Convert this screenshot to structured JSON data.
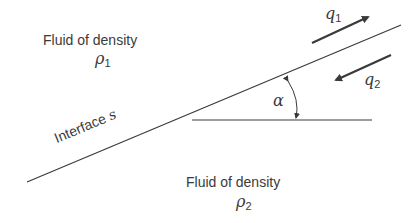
{
  "diagram": {
    "upper_fluid": {
      "label": "Fluid of density",
      "symbol": "ρ",
      "subscript": "1"
    },
    "lower_fluid": {
      "label": "Fluid of density",
      "symbol": "ρ",
      "subscript": "2"
    },
    "interface": {
      "label": "Interface",
      "symbol": "s"
    },
    "angle": {
      "symbol": "α"
    },
    "flow_upper": {
      "symbol": "q",
      "subscript": "1",
      "direction": "up-right"
    },
    "flow_lower": {
      "symbol": "q",
      "subscript": "2",
      "direction": "down-left"
    },
    "colors": {
      "line": "#3a3a3a",
      "text": "#3a3a3a",
      "background": "#ffffff"
    }
  }
}
